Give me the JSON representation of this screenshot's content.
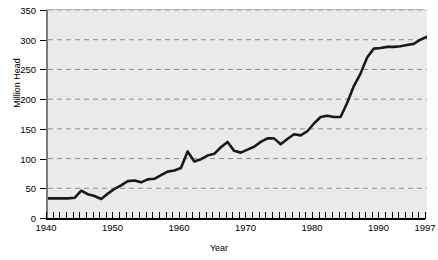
{
  "chart_data": {
    "type": "line",
    "title": "1940-1997",
    "xlabel": "Year",
    "ylabel": "Million Head",
    "xlim": [
      1940,
      1997
    ],
    "ylim": [
      0,
      350
    ],
    "y_ticks": [
      0,
      50,
      100,
      150,
      200,
      250,
      300,
      350
    ],
    "x_ticks_labeled": [
      1940,
      1950,
      1960,
      1970,
      1980,
      1990,
      1997
    ],
    "x_tick_step": 1,
    "grid": "horizontal-dashed",
    "legend": "none",
    "series": [
      {
        "name": "Million Head",
        "color": "#1a1a1a",
        "x": [
          1940,
          1941,
          1942,
          1943,
          1944,
          1945,
          1946,
          1947,
          1948,
          1949,
          1950,
          1951,
          1952,
          1953,
          1954,
          1955,
          1956,
          1957,
          1958,
          1959,
          1960,
          1961,
          1962,
          1963,
          1964,
          1965,
          1966,
          1967,
          1968,
          1969,
          1970,
          1971,
          1972,
          1973,
          1974,
          1975,
          1976,
          1977,
          1978,
          1979,
          1980,
          1981,
          1982,
          1983,
          1984,
          1985,
          1986,
          1987,
          1988,
          1989,
          1990,
          1991,
          1992,
          1993,
          1994,
          1995,
          1996,
          1997
        ],
        "values": [
          33,
          33,
          33,
          33,
          34,
          46,
          40,
          37,
          32,
          41,
          49,
          55,
          62,
          63,
          60,
          65,
          66,
          72,
          78,
          80,
          84,
          112,
          95,
          99,
          105,
          108,
          119,
          128,
          113,
          110,
          115,
          120,
          128,
          134,
          134,
          124,
          133,
          141,
          139,
          146,
          159,
          170,
          172,
          170,
          170,
          194,
          222,
          243,
          270,
          285,
          286,
          288,
          288,
          289,
          291,
          293,
          300,
          305
        ]
      }
    ]
  },
  "axes": {
    "y_tick_labels": [
      "350",
      "300",
      "250",
      "200",
      "150",
      "100",
      "50",
      "0"
    ],
    "x_tick_labels": [
      "1940",
      "1950",
      "1960",
      "1970",
      "1980",
      "1990",
      "1997"
    ]
  }
}
